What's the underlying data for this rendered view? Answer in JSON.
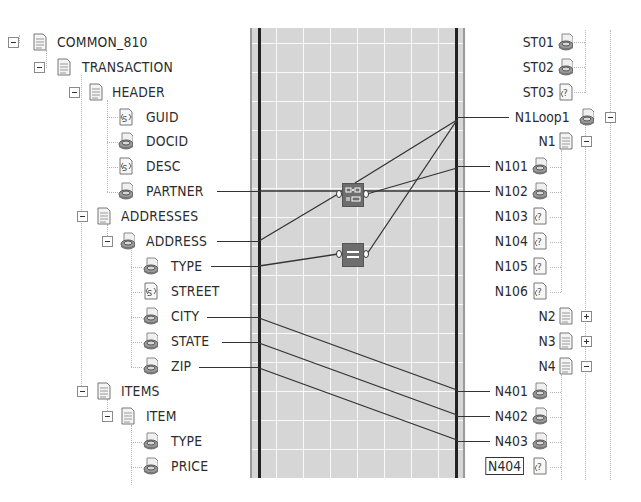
{
  "source_tree": {
    "nodes": [
      {
        "label": "COMMON_810",
        "depth": 0,
        "expander": "minus",
        "icon": "record-icon"
      },
      {
        "label": "TRANSACTION",
        "depth": 1,
        "expander": "minus",
        "icon": "record-icon"
      },
      {
        "label": "HEADER",
        "depth": 2,
        "expander": "minus",
        "icon": "record-icon"
      },
      {
        "label": "GUID",
        "depth": 3,
        "expander": "",
        "icon": "string-field-icon"
      },
      {
        "label": "DOCID",
        "depth": 3,
        "expander": "",
        "icon": "element-icon"
      },
      {
        "label": "DESC",
        "depth": 3,
        "expander": "",
        "icon": "string-field-icon"
      },
      {
        "label": "PARTNER",
        "depth": 3,
        "expander": "",
        "icon": "element-icon",
        "linked": true
      },
      {
        "label": "ADDRESSES",
        "depth": 2,
        "expander": "minus",
        "icon": "record-icon"
      },
      {
        "label": "ADDRESS",
        "depth": 3,
        "expander": "minus",
        "icon": "element-icon",
        "linked": true
      },
      {
        "label": "TYPE",
        "depth": 4,
        "expander": "",
        "icon": "element-icon",
        "linked": true
      },
      {
        "label": "STREET",
        "depth": 4,
        "expander": "",
        "icon": "string-field-icon"
      },
      {
        "label": "CITY",
        "depth": 4,
        "expander": "",
        "icon": "element-icon",
        "linked": true
      },
      {
        "label": "STATE",
        "depth": 4,
        "expander": "",
        "icon": "element-icon",
        "linked": true
      },
      {
        "label": "ZIP",
        "depth": 4,
        "expander": "",
        "icon": "element-icon",
        "linked": true
      },
      {
        "label": "ITEMS",
        "depth": 2,
        "expander": "minus",
        "icon": "record-icon"
      },
      {
        "label": "ITEM",
        "depth": 3,
        "expander": "minus",
        "icon": "record-icon"
      },
      {
        "label": "TYPE",
        "depth": 4,
        "expander": "",
        "icon": "element-icon"
      },
      {
        "label": "PRICE",
        "depth": 4,
        "expander": "",
        "icon": "element-icon"
      }
    ]
  },
  "destination_tree": {
    "nodes": [
      {
        "label": "ST01",
        "icon": "element-icon",
        "expander": ""
      },
      {
        "label": "ST02",
        "icon": "element-icon",
        "expander": ""
      },
      {
        "label": "ST03",
        "icon": "unknown-field-icon",
        "expander": ""
      },
      {
        "label": "N1Loop1",
        "icon": "element-icon",
        "expander": "minus",
        "linked": true
      },
      {
        "label": "N1",
        "icon": "record-icon",
        "expander": "minus"
      },
      {
        "label": "N101",
        "icon": "element-icon",
        "expander": "",
        "linked": true
      },
      {
        "label": "N102",
        "icon": "element-icon",
        "expander": "",
        "linked": true
      },
      {
        "label": "N103",
        "icon": "unknown-field-icon",
        "expander": ""
      },
      {
        "label": "N104",
        "icon": "unknown-field-icon",
        "expander": ""
      },
      {
        "label": "N105",
        "icon": "unknown-field-icon",
        "expander": ""
      },
      {
        "label": "N106",
        "icon": "unknown-field-icon",
        "expander": ""
      },
      {
        "label": "N2",
        "icon": "record-icon",
        "expander": "plus"
      },
      {
        "label": "N3",
        "icon": "record-icon",
        "expander": "plus"
      },
      {
        "label": "N4",
        "icon": "record-icon",
        "expander": "minus"
      },
      {
        "label": "N401",
        "icon": "element-icon",
        "expander": "",
        "linked": true
      },
      {
        "label": "N402",
        "icon": "element-icon",
        "expander": "",
        "linked": true
      },
      {
        "label": "N403",
        "icon": "element-icon",
        "expander": "",
        "linked": true
      },
      {
        "label": "N404",
        "icon": "unknown-field-icon",
        "expander": "",
        "selected": true
      }
    ]
  },
  "mapping_grid": {
    "functoids": [
      {
        "name": "string-concatenate-functoid",
        "icon": "concatenate-icon"
      },
      {
        "name": "equal-functoid",
        "icon": "equal-icon"
      }
    ],
    "colors": {
      "grid_bg": "#d6d6d6",
      "grid_lines": "#ffffff",
      "link": "#333333",
      "functoid": "#6d6d6d"
    }
  }
}
